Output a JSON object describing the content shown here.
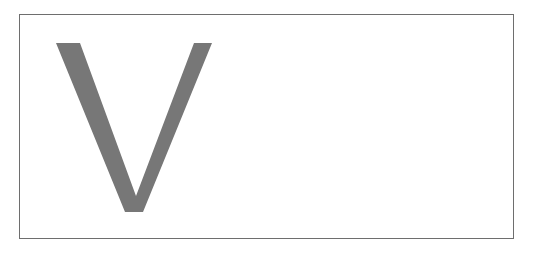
{
  "figure": {
    "glyph": "V",
    "glyph_color": "#777777",
    "frame_color": "#6e6e6e",
    "background_color": "#ffffff"
  }
}
